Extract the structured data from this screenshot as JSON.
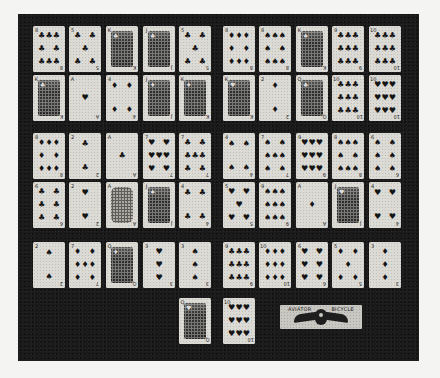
{
  "image": {
    "description": "Halftone photograph of 52 playing cards plus a joker-style advertising card laid out in a grid on a dark background",
    "background_color": "#1b1b1b",
    "card_color": "#dcdad4",
    "pip_color": "#141414"
  },
  "layout": {
    "card_width": 32,
    "card_height": 46,
    "row_tops": [
      12,
      61,
      119,
      168,
      228,
      284
    ],
    "left_group_cols": [
      15,
      51,
      88,
      125,
      161
    ],
    "right_group_cols": [
      205,
      241,
      278,
      314,
      351
    ]
  },
  "cards": [
    {
      "rank": "8",
      "suit": "♣",
      "row": 0,
      "col": 0,
      "type": "pips",
      "pips": "8"
    },
    {
      "rank": "5",
      "suit": "♣",
      "row": 0,
      "col": 1,
      "type": "pips",
      "pips": "5"
    },
    {
      "rank": "K",
      "suit": "♣",
      "row": 0,
      "col": 2,
      "type": "face"
    },
    {
      "rank": "J",
      "suit": "♣",
      "row": 0,
      "col": 3,
      "type": "face"
    },
    {
      "rank": "5",
      "suit": "♣",
      "row": 0,
      "col": 4,
      "type": "pips",
      "pips": "5"
    },
    {
      "rank": "8",
      "suit": "♦",
      "row": 0,
      "col": 5,
      "type": "pips",
      "pips": "8"
    },
    {
      "rank": "8",
      "suit": "♠",
      "row": 0,
      "col": 6,
      "type": "pips",
      "pips": "8"
    },
    {
      "rank": "K",
      "suit": "♠",
      "row": 0,
      "col": 7,
      "type": "face"
    },
    {
      "rank": "9",
      "suit": "♣",
      "row": 0,
      "col": 8,
      "type": "pips",
      "pips": "9"
    },
    {
      "rank": "10",
      "suit": "♣",
      "row": 0,
      "col": 9,
      "type": "pips",
      "pips": "10"
    },
    {
      "rank": "K",
      "suit": "♣",
      "row": 1,
      "col": 0,
      "type": "face"
    },
    {
      "rank": "A",
      "suit": "♥",
      "row": 1,
      "col": 1,
      "type": "pips",
      "pips": "1"
    },
    {
      "rank": "4",
      "suit": "♦",
      "row": 1,
      "col": 2,
      "type": "pips",
      "pips": "4"
    },
    {
      "rank": "J",
      "suit": "♦",
      "row": 1,
      "col": 3,
      "type": "face"
    },
    {
      "rank": "K",
      "suit": "♦",
      "row": 1,
      "col": 4,
      "type": "face"
    },
    {
      "rank": "K",
      "suit": "♥",
      "row": 1,
      "col": 5,
      "type": "face"
    },
    {
      "rank": "2",
      "suit": "♦",
      "row": 1,
      "col": 6,
      "type": "pips",
      "pips": "2"
    },
    {
      "rank": "Q",
      "suit": "♣",
      "row": 1,
      "col": 7,
      "type": "face"
    },
    {
      "rank": "10",
      "suit": "♣",
      "row": 1,
      "col": 8,
      "type": "pips",
      "pips": "10"
    },
    {
      "rank": "10",
      "suit": "♥",
      "row": 1,
      "col": 9,
      "type": "pips",
      "pips": "10"
    },
    {
      "rank": "8",
      "suit": "♦",
      "row": 2,
      "col": 0,
      "type": "pips",
      "pips": "8"
    },
    {
      "rank": "2",
      "suit": "♣",
      "row": 2,
      "col": 1,
      "type": "pips",
      "pips": "2"
    },
    {
      "rank": "A",
      "suit": "♣",
      "row": 2,
      "col": 2,
      "type": "pips",
      "pips": "1"
    },
    {
      "rank": "7",
      "suit": "♥",
      "row": 2,
      "col": 3,
      "type": "pips",
      "pips": "7"
    },
    {
      "rank": "7",
      "suit": "♣",
      "row": 2,
      "col": 4,
      "type": "pips",
      "pips": "7"
    },
    {
      "rank": "4",
      "suit": "♠",
      "row": 2,
      "col": 5,
      "type": "pips",
      "pips": "4"
    },
    {
      "rank": "7",
      "suit": "♠",
      "row": 2,
      "col": 6,
      "type": "pips",
      "pips": "7"
    },
    {
      "rank": "9",
      "suit": "♥",
      "row": 2,
      "col": 7,
      "type": "pips",
      "pips": "9"
    },
    {
      "rank": "8",
      "suit": "♠",
      "row": 2,
      "col": 8,
      "type": "pips",
      "pips": "8"
    },
    {
      "rank": "6",
      "suit": "♠",
      "row": 2,
      "col": 9,
      "type": "pips",
      "pips": "6"
    },
    {
      "rank": "6",
      "suit": "♣",
      "row": 3,
      "col": 0,
      "type": "pips",
      "pips": "6"
    },
    {
      "rank": "2",
      "suit": "♥",
      "row": 3,
      "col": 1,
      "type": "pips",
      "pips": "2"
    },
    {
      "rank": "A",
      "suit": "♠",
      "row": 3,
      "col": 2,
      "type": "ace"
    },
    {
      "rank": "J",
      "suit": "♠",
      "row": 3,
      "col": 3,
      "type": "face"
    },
    {
      "rank": "4",
      "suit": "♣",
      "row": 3,
      "col": 4,
      "type": "pips",
      "pips": "4"
    },
    {
      "rank": "5",
      "suit": "♥",
      "row": 3,
      "col": 5,
      "type": "pips",
      "pips": "5"
    },
    {
      "rank": "9",
      "suit": "♠",
      "row": 3,
      "col": 6,
      "type": "pips",
      "pips": "9"
    },
    {
      "rank": "A",
      "suit": "♦",
      "row": 3,
      "col": 7,
      "type": "pips",
      "pips": "1"
    },
    {
      "rank": "J",
      "suit": "♥",
      "row": 3,
      "col": 8,
      "type": "face"
    },
    {
      "rank": "4",
      "suit": "♥",
      "row": 3,
      "col": 9,
      "type": "pips",
      "pips": "4"
    },
    {
      "rank": "2",
      "suit": "♠",
      "row": 4,
      "col": 0,
      "type": "pips",
      "pips": "2"
    },
    {
      "rank": "7",
      "suit": "♦",
      "row": 4,
      "col": 1,
      "type": "pips",
      "pips": "7"
    },
    {
      "rank": "Q",
      "suit": "♦",
      "row": 4,
      "col": 2,
      "type": "face"
    },
    {
      "rank": "3",
      "suit": "♥",
      "row": 4,
      "col": 3,
      "type": "pips",
      "pips": "3"
    },
    {
      "rank": "3",
      "suit": "♠",
      "row": 4,
      "col": 4,
      "type": "pips",
      "pips": "3"
    },
    {
      "rank": "9",
      "suit": "♣",
      "row": 4,
      "col": 5,
      "type": "pips",
      "pips": "9"
    },
    {
      "rank": "10",
      "suit": "♦",
      "row": 4,
      "col": 6,
      "type": "pips",
      "pips": "10"
    },
    {
      "rank": "6",
      "suit": "♥",
      "row": 4,
      "col": 7,
      "type": "pips",
      "pips": "6"
    },
    {
      "rank": "5",
      "suit": "♦",
      "row": 4,
      "col": 8,
      "type": "pips",
      "pips": "5"
    },
    {
      "rank": "3",
      "suit": "♦",
      "row": 4,
      "col": 9,
      "type": "pips",
      "pips": "3"
    },
    {
      "rank": "Q",
      "suit": "♥",
      "row": 5,
      "col": 4,
      "type": "face"
    },
    {
      "rank": "10",
      "suit": "♥",
      "row": 5,
      "col": 5,
      "type": "pips",
      "pips": "10"
    }
  ],
  "special_card": {
    "left_word": "AVIATOR",
    "right_word": "BICYCLE",
    "emblem": "winged-emblem"
  }
}
